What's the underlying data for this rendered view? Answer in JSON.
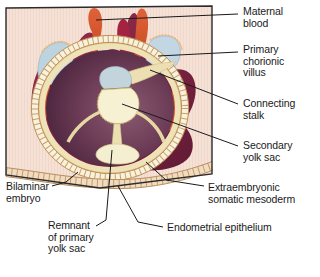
{
  "figure": {
    "frame": {
      "border_color": "#2b2b2b",
      "background_color": "#f6e3d8"
    }
  },
  "labels": [
    {
      "id": "maternal-blood",
      "text": "Maternal\nblood",
      "x": 243,
      "y": 6,
      "leader": "maternal-blood-leader"
    },
    {
      "id": "primary-chorionic-villus",
      "text": "Primary\nchorionic\nvillus",
      "x": 243,
      "y": 44,
      "leader": "primary-chorionic-villus-leader"
    },
    {
      "id": "connecting-stalk",
      "text": "Connecting\nstalk",
      "x": 243,
      "y": 98,
      "leader": "connecting-stalk-leader"
    },
    {
      "id": "secondary-yolk-sac",
      "text": "Secondary\nyolk sac",
      "x": 243,
      "y": 140,
      "leader": "secondary-yolk-sac-leader"
    },
    {
      "id": "extraembryonic-somatic-mesoderm",
      "text": "Extraembryonic\nsomatic mesoderm",
      "x": 208,
      "y": 182,
      "leader": "extraembryonic-somatic-mesoderm-leader"
    },
    {
      "id": "endometrial-epithelium",
      "text": "Endometrial epithelium",
      "x": 167,
      "y": 223,
      "leader": "endometrial-epithelium-leader"
    },
    {
      "id": "bilaminar-embryo",
      "text": "Bilaminar\nembryo",
      "x": 6,
      "y": 181,
      "leader": "bilaminar-embryo-leader"
    },
    {
      "id": "remnant-of-primary-yolk-sac",
      "text": "Remnant\nof primary\nyolk sac",
      "x": 48,
      "y": 220,
      "leader": "remnant-of-primary-yolk-sac-leader"
    }
  ],
  "anatomy": {
    "structures": [
      {
        "id": "endometrial-stroma",
        "name": "Endometrial stroma background",
        "color": "#f3ded2"
      },
      {
        "id": "trophoblast-mass",
        "name": "Syncytiotrophoblast mass",
        "color": "#8e2a4a"
      },
      {
        "id": "trophoblast-shade",
        "name": "Syncytiotrophoblast shading",
        "color": "#6d1f3c"
      },
      {
        "id": "primary-villus",
        "name": "Primary chorionic villus",
        "color": "#d4502b"
      },
      {
        "id": "villus-dark",
        "name": "Primary chorionic villus (dark)",
        "color": "#a02240"
      },
      {
        "id": "maternal-blood-lacuna",
        "name": "Maternal blood lacuna",
        "color": "#bcd3e0"
      },
      {
        "id": "chorionic-cavity",
        "name": "Chorionic cavity",
        "color": "#6b3a54"
      },
      {
        "id": "extraembryonic-mesoderm",
        "name": "Extraembryonic somatic mesoderm",
        "color": "#efe2b8"
      },
      {
        "id": "cytotrophoblast-ring",
        "name": "Cytotrophoblast beaded ring",
        "color": "#f6efd8"
      },
      {
        "id": "amniotic-cavity",
        "name": "Amniotic cavity",
        "color": "#c3d4dd"
      },
      {
        "id": "secondary-yolk-sac",
        "name": "Secondary yolk sac",
        "color": "#f7f1d4"
      },
      {
        "id": "bilaminar-disc",
        "name": "Bilaminar embryonic disc",
        "color": "#e8dcae"
      },
      {
        "id": "connecting-stalk",
        "name": "Connecting stalk",
        "color": "#ece0b2"
      },
      {
        "id": "primary-yolk-sac-remnant",
        "name": "Remnant of primary yolk sac",
        "color": "#f5efd2"
      },
      {
        "id": "endometrial-epithelium",
        "name": "Endometrial epithelium",
        "color": "#f0d9bd"
      }
    ],
    "leader_line_color": "#1a1a1a"
  }
}
